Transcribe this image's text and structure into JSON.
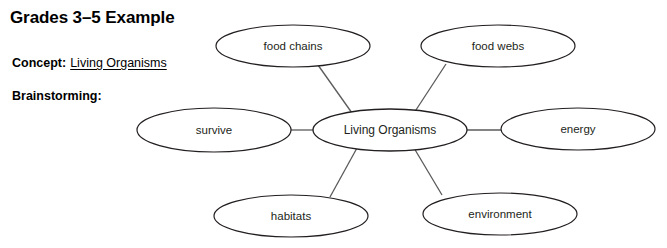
{
  "page": {
    "title": "Grades 3–5 Example",
    "background_color": "#ffffff",
    "ink_color": "#231f20",
    "connector_color": "#5a5a5a"
  },
  "fields": {
    "concept": {
      "label": "Concept:",
      "value": "Living Organisms"
    },
    "brainstorming": {
      "label": "Brainstorming:",
      "value": ""
    }
  },
  "concept_map": {
    "type": "bubble-map",
    "center": {
      "id": "living-organisms",
      "label": "Living Organisms",
      "cx": 390,
      "cy": 130,
      "rx": 77,
      "ry": 21
    },
    "nodes": [
      {
        "id": "food-chains",
        "label": "food chains",
        "cx": 293,
        "cy": 46,
        "rx": 77,
        "ry": 21
      },
      {
        "id": "food-webs",
        "label": "food webs",
        "cx": 498,
        "cy": 46,
        "rx": 77,
        "ry": 21
      },
      {
        "id": "survive",
        "label": "survive",
        "cx": 214,
        "cy": 130,
        "rx": 77,
        "ry": 22
      },
      {
        "id": "energy",
        "label": "energy",
        "cx": 578,
        "cy": 129,
        "rx": 77,
        "ry": 21
      },
      {
        "id": "habitats",
        "label": "habitats",
        "cx": 291,
        "cy": 216,
        "rx": 77,
        "ry": 21
      },
      {
        "id": "environment",
        "label": "environment",
        "cx": 500,
        "cy": 214,
        "rx": 77,
        "ry": 21
      }
    ],
    "edges": [
      {
        "id": "edge-food-chains",
        "from": "living-organisms",
        "to": "food-chains",
        "x1": 352,
        "y1": 113,
        "x2": 318,
        "y2": 65
      },
      {
        "id": "edge-food-webs",
        "from": "living-organisms",
        "to": "food-webs",
        "x1": 414,
        "y1": 113,
        "x2": 446,
        "y2": 64
      },
      {
        "id": "edge-survive",
        "from": "living-organisms",
        "to": "survive",
        "x1": 313,
        "y1": 130,
        "x2": 291,
        "y2": 130
      },
      {
        "id": "edge-energy",
        "from": "living-organisms",
        "to": "energy",
        "x1": 467,
        "y1": 130,
        "x2": 501,
        "y2": 130
      },
      {
        "id": "edge-habitats",
        "from": "living-organisms",
        "to": "habitats",
        "x1": 357,
        "y1": 148,
        "x2": 330,
        "y2": 197
      },
      {
        "id": "edge-environment",
        "from": "living-organisms",
        "to": "environment",
        "x1": 414,
        "y1": 148,
        "x2": 442,
        "y2": 195
      }
    ]
  }
}
